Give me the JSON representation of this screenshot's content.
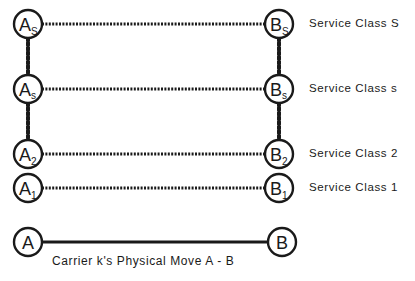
{
  "diagram": {
    "type": "service-class-hierarchy",
    "rows": [
      {
        "id": "S",
        "left": {
          "letter": "A",
          "sub": "S"
        },
        "right": {
          "letter": "B",
          "sub": "S"
        },
        "label": "Service Class S",
        "y": 24
      },
      {
        "id": "s",
        "left": {
          "letter": "A",
          "sub": "s"
        },
        "right": {
          "letter": "B",
          "sub": "s"
        },
        "label": "Service Class s",
        "y": 89
      },
      {
        "id": "2",
        "left": {
          "letter": "A",
          "sub": "2"
        },
        "right": {
          "letter": "B",
          "sub": "2"
        },
        "label": "Service Class 2",
        "y": 154
      },
      {
        "id": "1",
        "left": {
          "letter": "A",
          "sub": "1"
        },
        "right": {
          "letter": "B",
          "sub": "1"
        },
        "label": "Service Class 1",
        "y": 188
      }
    ],
    "physical_move": {
      "left": "A",
      "right": "B",
      "caption": "Carrier k's Physical Move A - B"
    },
    "line_color": "#1a1a1a"
  }
}
